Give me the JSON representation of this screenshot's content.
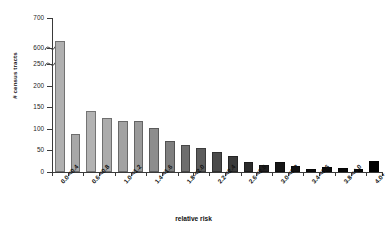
{
  "chart_data": {
    "type": "bar",
    "title": "",
    "xlabel": "relative risk",
    "ylabel": "# census tracts",
    "ylim": [
      0,
      700
    ],
    "grid": false,
    "legend": null,
    "axis_break": {
      "present": true,
      "lower_max": 250,
      "upper_min": 600,
      "note": "y-axis broken between 250 and 600"
    },
    "yticks": [
      0,
      50,
      100,
      150,
      200,
      250,
      600,
      700
    ],
    "categories": [
      "0.0-<0.4",
      "0.2-<0.4",
      "0.6-<0.8",
      "0.8-<1.0",
      "1.0-<1.2",
      "1.2-<1.4",
      "1.4-<1.6",
      "1.6-<1.8",
      "1.8-<2.0",
      "2.0-<2.2",
      "2.2-<2.4",
      "2.4-<2.6",
      "2.6-<2.8",
      "2.8-<3.0",
      "3.0-<3.2",
      "3.2-<3.4",
      "3.4-<3.6",
      "3.6-<3.8",
      "3.8-<4.0",
      "3.9-<4.0",
      "4.0+"
    ],
    "tick_labels_shown": [
      "0.0-<0.4",
      "0.6-<0.8",
      "1.0-<1.2",
      "1.4-<1.6",
      "1.8-<2.0",
      "2.2-<2.4",
      "2.6-<2.8",
      "3.0-<3.2",
      "3.4-<3.6",
      "3.8-<4.0",
      "4.0+"
    ],
    "values": [
      625,
      88,
      142,
      125,
      118,
      118,
      103,
      72,
      62,
      55,
      47,
      38,
      22,
      17,
      23,
      13,
      8,
      12,
      10,
      7,
      25
    ],
    "bar_colors": [
      "#b0b0b0",
      "#a8a8a8",
      "#b2b2b2",
      "#ababab",
      "#a2a2a2",
      "#9a9a9a",
      "#8d8d8d",
      "#7f7f7f",
      "#6e6e6e",
      "#5c5c5c",
      "#4a4a4a",
      "#3a3a3a",
      "#2b2b2b",
      "#202020",
      "#161616",
      "#111111",
      "#0d0d0d",
      "#0a0a0a",
      "#080808",
      "#060606",
      "#000000"
    ]
  },
  "axis": {
    "y_title": "# census tracts",
    "x_title": "relative risk"
  }
}
